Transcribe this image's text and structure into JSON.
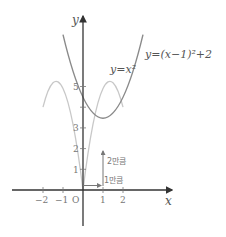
{
  "diagram": {
    "type": "function-graph",
    "axes": {
      "x_label": "x",
      "y_label": "y",
      "origin_label": "O",
      "x_ticks": [
        "−2",
        "−1",
        "1",
        "2"
      ],
      "y_ticks": [
        "1",
        "2",
        "3",
        "5"
      ]
    },
    "curves": [
      {
        "label": "y=x²",
        "expression": "x^2",
        "color": "#c4c4c4"
      },
      {
        "label": "y=(x−1)²+2",
        "expression": "(x-1)^2+2",
        "color": "#8c8c8c"
      }
    ],
    "annotations": {
      "horizontal_shift": "1만큼",
      "vertical_shift": "2만큼"
    },
    "colors": {
      "axis": "#333333",
      "shift_arrow": "#777777"
    }
  }
}
